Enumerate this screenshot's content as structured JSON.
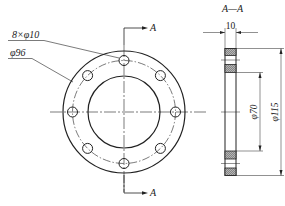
{
  "drawing": {
    "type": "flange-technical-drawing",
    "front_view": {
      "bolt_holes_label": "8×φ10",
      "bolt_circle_label": "φ96",
      "section_marker_top": "A",
      "section_marker_bottom": "A",
      "hole_count": 8
    },
    "section_view": {
      "title": "A—A",
      "thickness_label": "10",
      "bore_label": "φ70",
      "outer_label": "φ115"
    },
    "colors": {
      "line": "#222222",
      "hatch_fill": "#9a9a9a",
      "background": "#ffffff"
    }
  }
}
